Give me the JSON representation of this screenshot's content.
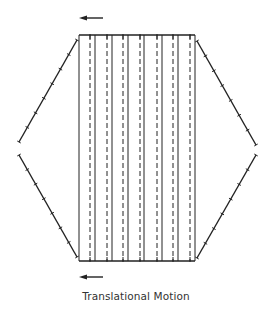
{
  "diagram": {
    "caption": "Translational Motion",
    "stroke_color": "#222222",
    "background": "#ffffff",
    "frame": {
      "top_y": 35,
      "bottom_y": 261,
      "left_x": 79,
      "right_x": 195
    },
    "solid_lines_x": [
      79,
      95,
      112,
      128,
      144,
      162,
      178,
      195
    ],
    "dashed_lines_x": [
      90,
      107,
      123,
      140,
      157,
      173,
      190
    ],
    "arrows": [
      {
        "name": "top-arrow",
        "direction": "left",
        "x1": 103,
        "x2": 79,
        "y": 18
      },
      {
        "name": "bottom-arrow",
        "direction": "left",
        "x1": 103,
        "x2": 79,
        "y": 277
      }
    ],
    "side_chains": [
      {
        "name": "left-upper-chain",
        "from": [
          77,
          40
        ],
        "to": [
          19,
          142
        ],
        "ticks": 7
      },
      {
        "name": "left-lower-chain",
        "from": [
          19,
          155
        ],
        "to": [
          77,
          257
        ],
        "ticks": 7
      },
      {
        "name": "right-upper-chain",
        "from": [
          197,
          41
        ],
        "to": [
          256,
          145
        ],
        "ticks": 7
      },
      {
        "name": "right-lower-chain",
        "from": [
          256,
          155
        ],
        "to": [
          197,
          258
        ],
        "ticks": 7
      }
    ]
  }
}
